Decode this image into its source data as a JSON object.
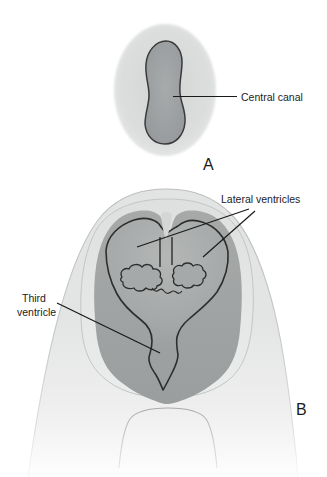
{
  "figure": {
    "panel_a": {
      "letter": "A",
      "label_central_canal": "Central canal"
    },
    "panel_b": {
      "letter": "B",
      "label_lateral_ventricles": "Lateral ventricles",
      "label_third_ventricle": {
        "line1": "Third",
        "line2": "ventricle"
      }
    },
    "colors": {
      "background": "#ffffff",
      "outer_tissue_light": "#dcdddd",
      "head_fill": "#e2e3e3",
      "inner_band_fill": "#dfe0e0",
      "brain_tissue_fill": "#a2a5a5",
      "ventricle_fill": "#a9acac",
      "central_canal_fill": "#9b9ea0",
      "dark_outline": "#333333",
      "leader_line": "#1a1a1a",
      "label_text": "#1b1b1b"
    }
  }
}
